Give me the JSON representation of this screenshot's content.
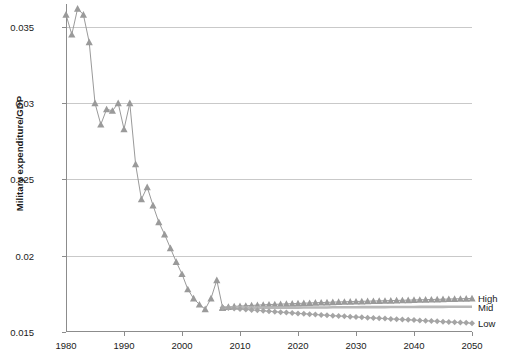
{
  "chart_data": {
    "type": "line",
    "title": "",
    "xlabel": "",
    "ylabel": "Military expenditure/GDP",
    "xlim": [
      1980,
      2050
    ],
    "ylim": [
      0.015,
      0.0365
    ],
    "grid": true,
    "legend_position": "right",
    "xticks": [
      1980,
      1990,
      2000,
      2010,
      2020,
      2030,
      2040,
      2050
    ],
    "xtick_labels": [
      "1980",
      "1990",
      "2000",
      "2010",
      "2020",
      "2030",
      "2040",
      "2050"
    ],
    "yticks": [
      0.015,
      0.02,
      0.025,
      0.03,
      0.035
    ],
    "ytick_labels": [
      "0.015",
      "0.02",
      "0.025",
      "0.03",
      "0.035"
    ],
    "series": [
      {
        "name": "Historical",
        "marker": "triangle",
        "color": "#9a9a9a",
        "show_in_legend": false,
        "x": [
          1980,
          1981,
          1982,
          1983,
          1984,
          1985,
          1986,
          1987,
          1988,
          1989,
          1990,
          1991,
          1992,
          1993,
          1994,
          1995,
          1996,
          1997,
          1998,
          1999,
          2000,
          2001,
          2002,
          2003,
          2004,
          2005,
          2006,
          2007
        ],
        "values": [
          0.0358,
          0.0345,
          0.0362,
          0.0358,
          0.034,
          0.03,
          0.0286,
          0.0296,
          0.0295,
          0.03,
          0.0283,
          0.03,
          0.026,
          0.0237,
          0.0245,
          0.0233,
          0.0222,
          0.0214,
          0.0205,
          0.0196,
          0.0188,
          0.0178,
          0.0172,
          0.0168,
          0.0165,
          0.0172,
          0.0184,
          0.0166
        ]
      },
      {
        "name": "High",
        "marker": "triangle",
        "color": "#9a9a9a",
        "show_in_legend": true,
        "x": [
          2007,
          2008,
          2009,
          2010,
          2011,
          2012,
          2013,
          2014,
          2015,
          2016,
          2017,
          2018,
          2019,
          2020,
          2021,
          2022,
          2023,
          2024,
          2025,
          2026,
          2027,
          2028,
          2029,
          2030,
          2031,
          2032,
          2033,
          2034,
          2035,
          2036,
          2037,
          2038,
          2039,
          2040,
          2041,
          2042,
          2043,
          2044,
          2045,
          2046,
          2047,
          2048,
          2049,
          2050
        ],
        "values": [
          0.0166,
          0.01665,
          0.01668,
          0.0167,
          0.01672,
          0.01674,
          0.01676,
          0.01678,
          0.0168,
          0.01681,
          0.01683,
          0.01684,
          0.01686,
          0.01687,
          0.01689,
          0.0169,
          0.01692,
          0.01693,
          0.01694,
          0.01696,
          0.01697,
          0.01698,
          0.01699,
          0.017,
          0.01701,
          0.01702,
          0.01703,
          0.01704,
          0.01705,
          0.01706,
          0.01707,
          0.01708,
          0.01709,
          0.0171,
          0.01711,
          0.01712,
          0.01713,
          0.01714,
          0.01715,
          0.01716,
          0.01717,
          0.01718,
          0.01719,
          0.0172
        ]
      },
      {
        "name": "Mid",
        "marker": "none",
        "color": "#b8b8b8",
        "show_in_legend": true,
        "x": [
          2007,
          2008,
          2009,
          2010,
          2011,
          2012,
          2013,
          2014,
          2015,
          2016,
          2017,
          2018,
          2019,
          2020,
          2021,
          2022,
          2023,
          2024,
          2025,
          2026,
          2027,
          2028,
          2029,
          2030,
          2031,
          2032,
          2033,
          2034,
          2035,
          2036,
          2037,
          2038,
          2039,
          2040,
          2041,
          2042,
          2043,
          2044,
          2045,
          2046,
          2047,
          2048,
          2049,
          2050
        ],
        "values": [
          0.0166,
          0.0166,
          0.0166,
          0.0166,
          0.0166,
          0.0166,
          0.0166,
          0.0166,
          0.0166,
          0.0166,
          0.0166,
          0.0166,
          0.0166,
          0.0166,
          0.01661,
          0.01661,
          0.01661,
          0.01661,
          0.01661,
          0.01662,
          0.01662,
          0.01662,
          0.01662,
          0.01662,
          0.01663,
          0.01663,
          0.01663,
          0.01663,
          0.01663,
          0.01664,
          0.01664,
          0.01664,
          0.01664,
          0.01664,
          0.01665,
          0.01665,
          0.01665,
          0.01665,
          0.01665,
          0.01666,
          0.01666,
          0.01666,
          0.01666,
          0.01666
        ]
      },
      {
        "name": "Low",
        "marker": "diamond",
        "color": "#a5a5a5",
        "show_in_legend": true,
        "x": [
          2007,
          2008,
          2009,
          2010,
          2011,
          2012,
          2013,
          2014,
          2015,
          2016,
          2017,
          2018,
          2019,
          2020,
          2021,
          2022,
          2023,
          2024,
          2025,
          2026,
          2027,
          2028,
          2029,
          2030,
          2031,
          2032,
          2033,
          2034,
          2035,
          2036,
          2037,
          2038,
          2039,
          2040,
          2041,
          2042,
          2043,
          2044,
          2045,
          2046,
          2047,
          2048,
          2049,
          2050
        ],
        "values": [
          0.0166,
          0.01657,
          0.01654,
          0.01651,
          0.01648,
          0.01645,
          0.01642,
          0.01639,
          0.01636,
          0.01633,
          0.0163,
          0.01628,
          0.01625,
          0.01622,
          0.0162,
          0.01617,
          0.01615,
          0.01612,
          0.0161,
          0.01607,
          0.01605,
          0.01603,
          0.016,
          0.01598,
          0.01596,
          0.01594,
          0.01592,
          0.0159,
          0.01588,
          0.01586,
          0.01584,
          0.01582,
          0.0158,
          0.01578,
          0.01576,
          0.01574,
          0.01572,
          0.0157,
          0.01568,
          0.01566,
          0.01564,
          0.01562,
          0.0156,
          0.01558
        ]
      }
    ],
    "legend_entries": [
      {
        "label": "High"
      },
      {
        "label": "Mid"
      },
      {
        "label": "Low"
      }
    ]
  },
  "colors": {
    "axis": "#8c8c8c",
    "grid": "#c9c9c9",
    "text": "#1a1a1a",
    "high": "#9a9a9a",
    "mid": "#b8b8b8",
    "low": "#a5a5a5"
  }
}
